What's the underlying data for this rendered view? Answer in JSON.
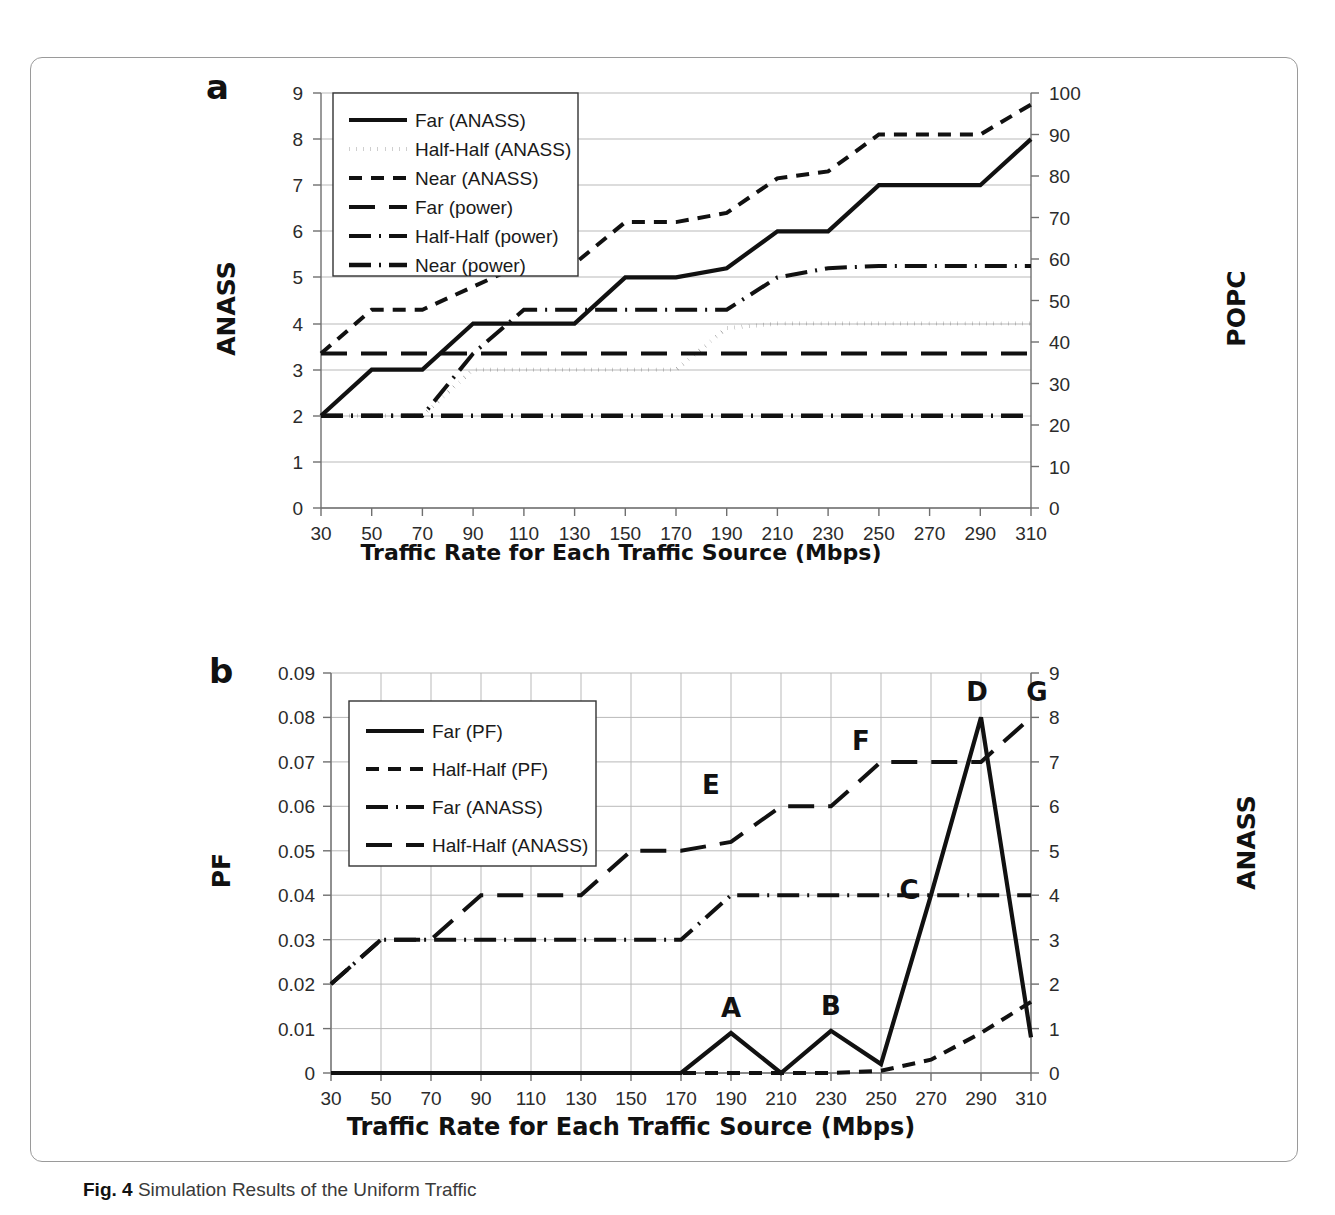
{
  "figure": {
    "caption_label": "Fig. 4",
    "caption_text": "Simulation Results of the Uniform Traffic"
  },
  "panel_a": {
    "letter": "a",
    "y_axis_left_title": "ANASS",
    "y_axis_right_title": "POPC",
    "x_axis_title": "Traffic Rate for Each Traffic Source (Mbps)",
    "legend": [
      "Far (ANASS)",
      "Half-Half (ANASS)",
      "Near (ANASS)",
      "Far (power)",
      "Half-Half (power)",
      "Near (power)"
    ]
  },
  "panel_b": {
    "letter": "b",
    "y_axis_left_title": "PF",
    "y_axis_right_title": "ANASS",
    "x_axis_title": "Traffic Rate for Each Traffic Source (Mbps)",
    "legend": [
      "Far (PF)",
      "Half-Half (PF)",
      "Far (ANASS)",
      "Half-Half (ANASS)"
    ],
    "annotations": [
      "A",
      "B",
      "C",
      "D",
      "E",
      "F",
      "G"
    ]
  },
  "chart_data": [
    {
      "id": "panel_a",
      "type": "line",
      "title": "a",
      "xlabel": "Traffic Rate for Each Traffic Source (Mbps)",
      "ylabel": "ANASS",
      "y2label": "POPC",
      "xlim": [
        30,
        310
      ],
      "ylim": [
        0,
        9
      ],
      "y2lim": [
        0,
        100
      ],
      "grid": true,
      "legend_position": "top-left-inside",
      "x": [
        30,
        50,
        70,
        90,
        110,
        130,
        150,
        170,
        190,
        210,
        230,
        250,
        270,
        290,
        310
      ],
      "xticks": [
        30,
        50,
        70,
        90,
        110,
        130,
        150,
        170,
        190,
        210,
        230,
        250,
        270,
        290,
        310
      ],
      "yticks": [
        0,
        1,
        2,
        3,
        4,
        5,
        6,
        7,
        8,
        9
      ],
      "y2ticks": [
        0,
        10,
        20,
        30,
        40,
        50,
        60,
        70,
        80,
        90,
        100
      ],
      "series": [
        {
          "name": "Far (ANASS)",
          "axis": "left",
          "style": "solid",
          "values": [
            2,
            3,
            3,
            4,
            4,
            4,
            5,
            5,
            5.2,
            6,
            6,
            7,
            7,
            7,
            8
          ]
        },
        {
          "name": "Half-Half (ANASS)",
          "axis": "left",
          "style": "dotted",
          "values": [
            2,
            2,
            2,
            3,
            3,
            3,
            3,
            3,
            3.9,
            4,
            4,
            4,
            4,
            4,
            4
          ]
        },
        {
          "name": "Near (ANASS)",
          "axis": "left",
          "style": "dashed",
          "values": [
            3.35,
            4.3,
            4.3,
            4.8,
            5.3,
            5.3,
            6.2,
            6.2,
            6.4,
            7.15,
            7.3,
            8.1,
            8.1,
            8.1,
            8.75
          ]
        },
        {
          "name": "Far (power)",
          "axis": "left",
          "style": "long-dash",
          "values": [
            3.35,
            3.35,
            3.35,
            3.35,
            3.35,
            3.35,
            3.35,
            3.35,
            3.35,
            3.35,
            3.35,
            3.35,
            3.35,
            3.35,
            3.35
          ]
        },
        {
          "name": "Half-Half (power)",
          "axis": "left",
          "style": "dash-dot",
          "values": [
            2,
            2,
            2,
            3.35,
            4.3,
            4.3,
            4.3,
            4.3,
            4.3,
            5.0,
            5.2,
            5.25,
            5.25,
            5.25,
            5.25
          ]
        },
        {
          "name": "Near (power)",
          "axis": "left",
          "style": "dash-dot-bold",
          "values": [
            2,
            2,
            2,
            2,
            2,
            2,
            2,
            2,
            2,
            2,
            2,
            2,
            2,
            2,
            2
          ]
        }
      ]
    },
    {
      "id": "panel_b",
      "type": "line",
      "title": "b",
      "xlabel": "Traffic Rate for Each Traffic Source (Mbps)",
      "ylabel": "PF",
      "y2label": "ANASS",
      "xlim": [
        30,
        310
      ],
      "ylim": [
        0,
        0.09
      ],
      "y2lim": [
        0,
        9
      ],
      "grid": true,
      "legend_position": "top-left-inside",
      "x": [
        30,
        50,
        70,
        90,
        110,
        130,
        150,
        170,
        190,
        210,
        230,
        250,
        270,
        290,
        310
      ],
      "xticks": [
        30,
        50,
        70,
        90,
        110,
        130,
        150,
        170,
        190,
        210,
        230,
        250,
        270,
        290,
        310
      ],
      "yticks": [
        0,
        0.01,
        0.02,
        0.03,
        0.04,
        0.05,
        0.06,
        0.07,
        0.08,
        0.09
      ],
      "ytick_labels": [
        "0",
        "0.01",
        "0.02",
        "0.03",
        "0.04",
        "0.05",
        "0.06",
        "0.07",
        "0.08",
        "0.09"
      ],
      "y2ticks": [
        0,
        1,
        2,
        3,
        4,
        5,
        6,
        7,
        8,
        9
      ],
      "series": [
        {
          "name": "Far (PF)",
          "axis": "left",
          "style": "solid",
          "values": [
            0,
            0,
            0,
            0,
            0,
            0,
            0,
            0,
            0.009,
            0,
            0.0095,
            0.002,
            0.04,
            0.08,
            0.008
          ]
        },
        {
          "name": "Half-Half (PF)",
          "axis": "left",
          "style": "dashed",
          "values": [
            0,
            0,
            0,
            0,
            0,
            0,
            0,
            0,
            0,
            0,
            0,
            0.0005,
            0.003,
            0.009,
            0.016
          ]
        },
        {
          "name": "Far (ANASS)",
          "axis": "right",
          "style": "dash-dot",
          "values": [
            2,
            3,
            3,
            3,
            3,
            3,
            3,
            3,
            4,
            4,
            4,
            4,
            4,
            4,
            4
          ]
        },
        {
          "name": "Half-Half (ANASS)",
          "axis": "right",
          "style": "long-dash",
          "values": [
            2,
            3,
            3,
            4,
            4,
            4,
            5,
            5,
            5.2,
            6,
            6,
            7,
            7,
            7,
            8
          ]
        }
      ],
      "annotations": [
        {
          "label": "A",
          "x": 190,
          "y": 0.009,
          "axis": "left"
        },
        {
          "label": "B",
          "x": 230,
          "y": 0.0095,
          "axis": "left"
        },
        {
          "label": "C",
          "x": 270,
          "y": 0.04,
          "axis": "left"
        },
        {
          "label": "D",
          "x": 290,
          "y": 0.08,
          "axis": "left"
        },
        {
          "label": "E",
          "x": 190,
          "y": 6,
          "axis": "right"
        },
        {
          "label": "F",
          "x": 250,
          "y": 7,
          "axis": "right"
        },
        {
          "label": "G",
          "x": 310,
          "y": 8,
          "axis": "right"
        }
      ]
    }
  ]
}
